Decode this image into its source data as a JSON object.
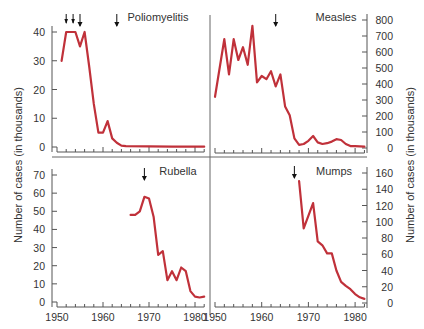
{
  "colors": {
    "line": "#c0313a",
    "axis": "#555555",
    "text": "#333333"
  },
  "shared": {
    "ylabel": "Number of cases (in thousands)",
    "x_ticks": [
      "1950",
      "1960",
      "1970",
      "1980"
    ]
  },
  "chart_data": [
    {
      "type": "line",
      "title": "Poliomyelitis",
      "xlabel": "",
      "ylabel": "Number of cases (in thousands)",
      "y_axis_side": "left",
      "ylim": [
        0,
        40
      ],
      "y_ticks": [
        0,
        10,
        20,
        30,
        40
      ],
      "xlim": [
        1950,
        1982
      ],
      "x": [
        1951,
        1952,
        1953,
        1954,
        1955,
        1956,
        1957,
        1958,
        1959,
        1960,
        1961,
        1962,
        1963,
        1964,
        1965,
        1970,
        1975,
        1980,
        1982
      ],
      "values": [
        30,
        40,
        40,
        40,
        35,
        40,
        28,
        15,
        5,
        5,
        9,
        3,
        1.5,
        0.5,
        0.3,
        0.2,
        0.1,
        0.1,
        0.1
      ],
      "arrows": [
        1952,
        1953.5,
        1955,
        1963
      ]
    },
    {
      "type": "line",
      "title": "Measles",
      "xlabel": "",
      "ylabel": "Number of cases (in thousands)",
      "y_axis_side": "right",
      "ylim": [
        0,
        800
      ],
      "y_ticks": [
        0,
        100,
        200,
        300,
        400,
        500,
        600,
        700,
        800
      ],
      "xlim": [
        1950,
        1982
      ],
      "x": [
        1950,
        1952,
        1953,
        1954,
        1955,
        1956,
        1957,
        1958,
        1959,
        1960,
        1961,
        1962,
        1963,
        1964,
        1965,
        1966,
        1967,
        1968,
        1969,
        1970,
        1971,
        1972,
        1973,
        1974,
        1975,
        1976,
        1977,
        1978,
        1979,
        1980,
        1981,
        1982
      ],
      "values": [
        320,
        680,
        460,
        680,
        550,
        630,
        520,
        763,
        410,
        450,
        430,
        480,
        385,
        460,
        260,
        205,
        60,
        20,
        25,
        45,
        75,
        35,
        25,
        30,
        40,
        55,
        50,
        25,
        12,
        12,
        10,
        8
      ],
      "arrows": [
        1963
      ]
    },
    {
      "type": "line",
      "title": "Rubella",
      "xlabel": "",
      "ylabel": "Number of cases (in thousands)",
      "y_axis_side": "left",
      "ylim": [
        0,
        70
      ],
      "y_ticks": [
        0,
        10,
        20,
        30,
        40,
        50,
        60,
        70
      ],
      "xlim": [
        1950,
        1982
      ],
      "x": [
        1966,
        1967,
        1968,
        1969,
        1970,
        1971,
        1972,
        1973,
        1974,
        1975,
        1976,
        1977,
        1978,
        1979,
        1980,
        1981,
        1982
      ],
      "values": [
        48,
        48,
        50,
        58,
        57,
        47,
        26,
        28,
        12,
        17,
        12,
        19,
        17,
        6,
        3,
        2.5,
        3
      ],
      "arrows": [
        1969
      ]
    },
    {
      "type": "line",
      "title": "Mumps",
      "xlabel": "",
      "ylabel": "Number of cases (in thousands)",
      "y_axis_side": "right",
      "ylim": [
        0,
        160
      ],
      "y_ticks": [
        0,
        20,
        40,
        60,
        80,
        100,
        120,
        140,
        160
      ],
      "xlim": [
        1950,
        1982
      ],
      "x": [
        1968,
        1969,
        1971,
        1972,
        1973,
        1974,
        1975,
        1976,
        1977,
        1978,
        1979,
        1980,
        1981,
        1982
      ],
      "values": [
        150,
        92,
        123,
        76,
        71,
        61,
        61,
        40,
        26,
        21,
        17,
        11,
        7,
        5
      ],
      "arrows": [
        1967
      ]
    }
  ]
}
